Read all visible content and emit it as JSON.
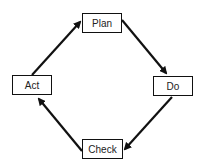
{
  "diagram": {
    "type": "cycle",
    "nodes": [
      {
        "id": "plan",
        "label": "Plan"
      },
      {
        "id": "do",
        "label": "Do"
      },
      {
        "id": "check",
        "label": "Check"
      },
      {
        "id": "act",
        "label": "Act"
      }
    ],
    "edges": [
      {
        "from": "plan",
        "to": "do"
      },
      {
        "from": "do",
        "to": "check"
      },
      {
        "from": "check",
        "to": "act"
      },
      {
        "from": "act",
        "to": "plan"
      }
    ],
    "colors": {
      "stroke": "#111111",
      "background": "#ffffff"
    }
  }
}
